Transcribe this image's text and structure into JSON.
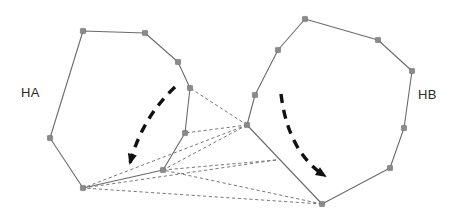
{
  "figure": {
    "width": 467,
    "height": 220,
    "background": "#ffffff",
    "type": "shape-correspondence-diagram"
  },
  "labels": {
    "left_region": "HA",
    "right_region": "HB"
  },
  "colors": {
    "polygon_edge": "#6b6b6b",
    "vertex_marker": "#8a8a8a",
    "correspondence_line": "#787878",
    "motion_arrow": "#111111",
    "label_text": "#2a2a2a"
  },
  "chart_data": {
    "type": "scatter",
    "title": "",
    "xlabel": "",
    "ylabel": "",
    "xlim": [
      0,
      467
    ],
    "ylim": [
      0,
      220
    ],
    "grid": false,
    "legend": "none",
    "annotations": [
      "HA",
      "HB"
    ],
    "series": [
      {
        "name": "HA",
        "kind": "polygon",
        "closed": true,
        "label": "HA",
        "marker": "square",
        "points": [
          [
            83,
            31
          ],
          [
            145,
            33
          ],
          [
            178,
            62
          ],
          [
            190,
            88
          ],
          [
            185,
            133
          ],
          [
            163,
            170
          ],
          [
            83,
            188
          ],
          [
            50,
            138
          ]
        ]
      },
      {
        "name": "HB",
        "kind": "polygon",
        "closed": true,
        "label": "HB",
        "marker": "square",
        "points": [
          [
            305,
            19
          ],
          [
            378,
            40
          ],
          [
            412,
            71
          ],
          [
            404,
            128
          ],
          [
            390,
            168
          ],
          [
            322,
            204
          ],
          [
            247,
            125
          ],
          [
            255,
            95
          ],
          [
            278,
            50
          ]
        ]
      },
      {
        "name": "correspondences",
        "kind": "dashed-links",
        "links": [
          [
            [
              247,
              125
            ],
            [
              190,
              88
            ]
          ],
          [
            [
              247,
              125
            ],
            [
              185,
              133
            ]
          ],
          [
            [
              247,
              125
            ],
            [
              163,
              170
            ]
          ],
          [
            [
              247,
              125
            ],
            [
              83,
              188
            ]
          ],
          [
            [
              276,
              160
            ],
            [
              163,
              170
            ]
          ],
          [
            [
              276,
              160
            ],
            [
              83,
              188
            ]
          ],
          [
            [
              322,
              204
            ],
            [
              163,
              170
            ]
          ],
          [
            [
              322,
              204
            ],
            [
              83,
              188
            ]
          ]
        ]
      },
      {
        "name": "motion-HA",
        "kind": "curved-arrow",
        "start": [
          175,
          87
        ],
        "control": [
          142,
          118
        ],
        "end": [
          130,
          163
        ],
        "direction": "down-left"
      },
      {
        "name": "motion-HB",
        "kind": "curved-arrow",
        "start": [
          281,
          94
        ],
        "control": [
          288,
          152
        ],
        "end": [
          325,
          176
        ],
        "direction": "down-right"
      }
    ]
  }
}
